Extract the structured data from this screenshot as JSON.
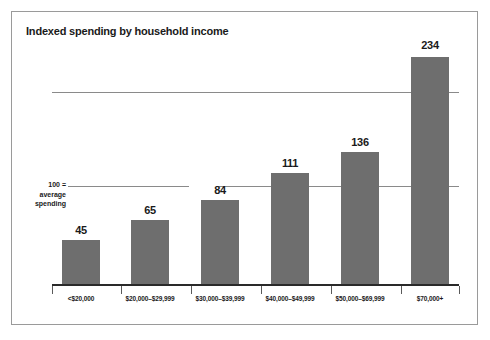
{
  "chart_data": {
    "type": "bar",
    "title": "Indexed spending by household income",
    "xlabel": "",
    "ylabel": "",
    "categories": [
      "<$20,000",
      "$20,000–$29,999",
      "$30,000–$39,999",
      "$40,000–$49,999",
      "$50,000–$69,999",
      "$70,000+"
    ],
    "values": [
      45,
      65,
      84,
      111,
      136,
      234
    ],
    "ylim": [
      0,
      240
    ],
    "gridlines": [
      100,
      200
    ],
    "grid": true,
    "legend": null,
    "annotations": [
      {
        "at_value": 100,
        "lines": [
          "100 =",
          "average",
          "spending"
        ]
      }
    ],
    "bar_color": "#6e6e6e",
    "axis_color": "#2a2a2a",
    "gridline_color": "#8a8a8a",
    "label_color": "#1a1a1a"
  },
  "axis_note": {
    "line1": "100 =",
    "line2": "average",
    "line3": "spending"
  },
  "bars": [
    {
      "label": "<$20,000",
      "value": "45",
      "left": 62,
      "width": 38,
      "top": 240,
      "height": 44,
      "value_left": 52,
      "value_top": 224
    },
    {
      "label": "$20,000–$29,999",
      "value": "65",
      "left": 131,
      "width": 38,
      "top": 220,
      "height": 64,
      "value_left": 121,
      "value_top": 204
    },
    {
      "label": "$30,000–$39,999",
      "value": "84",
      "left": 201,
      "width": 38,
      "top": 200,
      "height": 84,
      "value_left": 191,
      "value_top": 184
    },
    {
      "label": "$40,000–$49,999",
      "value": "111",
      "left": 271,
      "width": 38,
      "top": 173,
      "height": 111,
      "value_left": 261,
      "value_top": 157
    },
    {
      "label": "$50,000–$69,999",
      "value": "136",
      "left": 341,
      "width": 38,
      "top": 152,
      "height": 132,
      "value_left": 331,
      "value_top": 136
    },
    {
      "label": "$70,000+",
      "value": "234",
      "left": 411,
      "width": 38,
      "top": 57,
      "height": 227,
      "value_left": 401,
      "value_top": 39
    }
  ],
  "gridlines": [
    {
      "name": "gridline-200",
      "top": 92,
      "left": 52,
      "width": 359
    },
    {
      "name": "gridline-100",
      "top": 186,
      "left": 68,
      "width": 121
    }
  ],
  "gridline_segments": [
    {
      "name": "gridline-100-segment-b",
      "top": 186,
      "left": 216,
      "width": 55
    },
    {
      "name": "gridline-100-segment-c",
      "top": 186,
      "left": 309,
      "width": 32
    },
    {
      "name": "gridline-100-segment-d",
      "top": 186,
      "left": 379,
      "width": 32
    },
    {
      "name": "gridline-100-stub-right",
      "top": 186,
      "left": 449,
      "width": 10
    },
    {
      "name": "gridline-200-stub-right",
      "top": 92,
      "left": 449,
      "width": 10
    }
  ],
  "xticks": [
    52,
    121,
    191,
    261,
    331,
    401,
    459
  ]
}
